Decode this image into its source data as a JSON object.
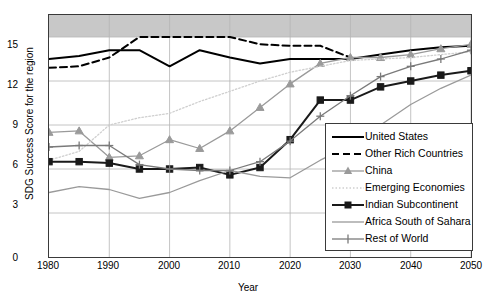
{
  "chart_data": {
    "type": "line",
    "title": "",
    "xlabel": "Year",
    "ylabel": "SDG Success Score for the region",
    "xlim": [
      1980,
      2050
    ],
    "ylim": [
      0,
      16.5
    ],
    "xticks": [
      1980,
      1990,
      2000,
      2010,
      2020,
      2030,
      2040,
      2050
    ],
    "yticks": [
      0,
      3,
      6,
      9,
      12,
      15
    ],
    "grid": true,
    "legend_position": "lower-right",
    "shaded_band": {
      "label": "",
      "from": 15,
      "to": 16.5,
      "color": "#c8c8c8"
    },
    "x": [
      1980,
      1985,
      1990,
      1995,
      2000,
      2005,
      2010,
      2015,
      2020,
      2025,
      2030,
      2035,
      2040,
      2045,
      2050
    ],
    "series": [
      {
        "name": "United States",
        "color": "#000000",
        "style": "solid",
        "marker": "none",
        "values": [
          13.5,
          13.7,
          14.1,
          14.1,
          13.0,
          14.1,
          13.6,
          13.2,
          13.5,
          13.5,
          13.5,
          13.8,
          14.1,
          14.3,
          14.4
        ]
      },
      {
        "name": "Other Rich Countries",
        "color": "#000000",
        "style": "dashed",
        "marker": "none",
        "values": [
          12.9,
          13.0,
          13.6,
          15.0,
          15.0,
          15.0,
          15.0,
          14.5,
          14.4,
          14.4,
          13.6,
          null,
          null,
          null,
          null
        ]
      },
      {
        "name": "China",
        "color": "#9a9a9a",
        "style": "solid",
        "marker": "triangle",
        "values": [
          8.5,
          8.6,
          6.8,
          6.9,
          8.0,
          7.4,
          8.6,
          10.2,
          11.8,
          13.2,
          13.6,
          13.6,
          13.8,
          14.2,
          14.5
        ]
      },
      {
        "name": "Emerging Economies",
        "color": "#cfcfcf",
        "style": "dotted",
        "marker": "none",
        "values": [
          6.6,
          7.2,
          9.0,
          9.5,
          9.8,
          10.6,
          11.3,
          12.0,
          12.6,
          13.0,
          13.4,
          13.5,
          13.6,
          13.8,
          14.0
        ]
      },
      {
        "name": "Indian Subcontinent",
        "color": "#1a1a1a",
        "style": "solid",
        "marker": "square",
        "values": [
          6.5,
          6.5,
          6.4,
          6.0,
          6.0,
          6.1,
          5.6,
          6.1,
          8.0,
          10.7,
          10.7,
          11.6,
          12.0,
          12.4,
          12.7
        ]
      },
      {
        "name": "Africa South of Sahara",
        "color": "#9a9a9a",
        "style": "solid",
        "marker": "none",
        "values": [
          4.4,
          4.8,
          4.6,
          4.0,
          4.4,
          5.2,
          5.9,
          5.5,
          5.4,
          6.6,
          7.6,
          9.0,
          10.4,
          11.5,
          12.4
        ]
      },
      {
        "name": "Rest of World",
        "color": "#7a7a7a",
        "style": "solid",
        "marker": "plus",
        "values": [
          7.5,
          7.6,
          7.6,
          6.3,
          6.0,
          5.9,
          5.9,
          6.5,
          7.9,
          9.6,
          11.0,
          12.3,
          13.0,
          13.5,
          14.1
        ]
      }
    ]
  },
  "axis": {
    "ylabel": "SDG Success Score for the region",
    "xlabel": "Year",
    "yticks": [
      "15",
      "12",
      "9",
      "6",
      "3",
      "0"
    ],
    "xticks": [
      "1980",
      "1990",
      "2000",
      "2010",
      "2020",
      "2030",
      "2040",
      "2050"
    ]
  },
  "legend": {
    "items": [
      {
        "label": "United States"
      },
      {
        "label": "Other Rich Countries"
      },
      {
        "label": "China"
      },
      {
        "label": "Emerging Economies"
      },
      {
        "label": "Indian Subcontinent"
      },
      {
        "label": "Africa South of Sahara"
      },
      {
        "label": "Rest of World"
      }
    ]
  }
}
